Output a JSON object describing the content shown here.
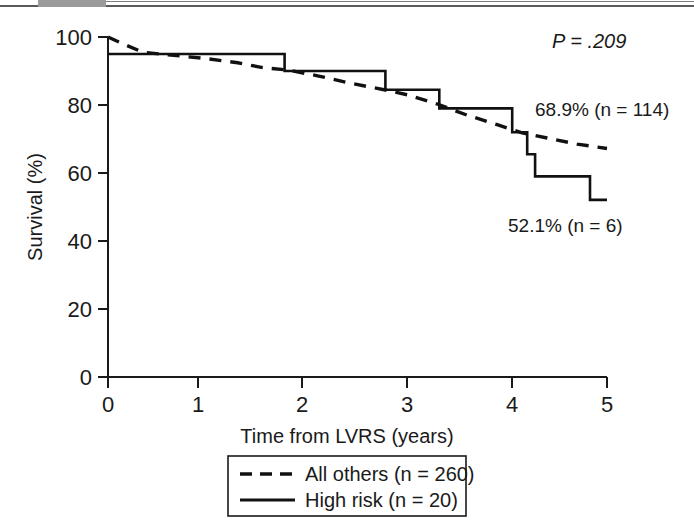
{
  "figure": {
    "scan_artifact": "gray-header-bar"
  },
  "chart_data": {
    "type": "line",
    "title": "",
    "subtitle": "",
    "xlabel": "Time from LVRS (years)",
    "ylabel": "Survival (%)",
    "xlim": [
      0,
      5
    ],
    "ylim": [
      0,
      100
    ],
    "xticks": [
      "0",
      "1",
      "2",
      "3",
      "4",
      "5"
    ],
    "yticks": [
      "0",
      "20",
      "40",
      "60",
      "80",
      "100"
    ],
    "grid": false,
    "legend_position": "bottom-center",
    "series": [
      {
        "name": "All others (n = 260)",
        "style": "dashed",
        "color": "#111111",
        "n": 260,
        "endpoint_label": "68.9% (n = 114)",
        "endpoint_value": 68.9,
        "endpoint_n": 114,
        "points": [
          [
            0.0,
            100.0
          ],
          [
            0.15,
            98.0
          ],
          [
            0.35,
            95.5
          ],
          [
            0.6,
            94.8
          ],
          [
            1.0,
            93.6
          ],
          [
            1.3,
            92.4
          ],
          [
            1.55,
            91.0
          ],
          [
            1.8,
            90.3
          ],
          [
            2.1,
            88.6
          ],
          [
            2.4,
            86.6
          ],
          [
            2.8,
            84.3
          ],
          [
            3.0,
            83.0
          ],
          [
            3.3,
            80.3
          ],
          [
            3.6,
            77.0
          ],
          [
            3.9,
            74.2
          ],
          [
            4.15,
            71.8
          ],
          [
            4.4,
            70.3
          ],
          [
            4.7,
            68.5
          ],
          [
            5.0,
            67.2
          ]
        ]
      },
      {
        "name": "High risk (n = 20)",
        "style": "solid",
        "color": "#111111",
        "n": 20,
        "endpoint_label": "52.1% (n = 6)",
        "endpoint_value": 52.1,
        "endpoint_n": 6,
        "steps": [
          [
            0.0,
            95.0
          ],
          [
            1.77,
            95.0
          ],
          [
            1.77,
            90.0
          ],
          [
            2.78,
            90.0
          ],
          [
            2.78,
            84.5
          ],
          [
            3.32,
            84.5
          ],
          [
            3.32,
            79.0
          ],
          [
            4.05,
            79.0
          ],
          [
            4.05,
            72.0
          ],
          [
            4.2,
            72.0
          ],
          [
            4.2,
            65.5
          ],
          [
            4.28,
            65.5
          ],
          [
            4.28,
            59.0
          ],
          [
            4.83,
            59.0
          ],
          [
            4.83,
            52.1
          ],
          [
            5.0,
            52.1
          ]
        ]
      }
    ],
    "annotations": [
      {
        "name": "p-value",
        "text": "P = .209",
        "x": 4.35,
        "y": 97
      },
      {
        "name": "all-others-endpoint",
        "text": "68.9% (n = 114)",
        "x": 4.35,
        "y": 84
      },
      {
        "name": "high-risk-endpoint",
        "text": "52.1% (n = 6)",
        "x": 4.1,
        "y": 47
      }
    ]
  },
  "legend": {
    "items": [
      {
        "label": "All others (n = 260)",
        "style": "dashed"
      },
      {
        "label": "High risk (n = 20)",
        "style": "solid"
      }
    ]
  }
}
